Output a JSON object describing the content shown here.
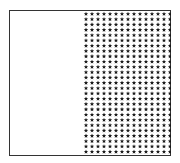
{
  "figure": {
    "frame_color": "#333333",
    "background": "#ffffff",
    "left_pane": {
      "content": "empty"
    },
    "star_pane": {
      "icon": "star-icon",
      "star_color": "#1a1a1a",
      "columns": 15,
      "rows": 27,
      "col_spacing_px": 6,
      "row_spacing_px": 5.3
    }
  }
}
